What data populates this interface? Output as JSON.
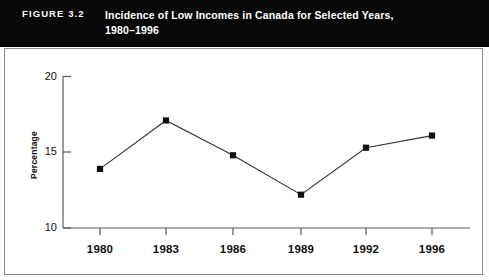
{
  "figure": {
    "label": "FIGURE 3.2",
    "title_line1": "Incidence of Low Incomes in Canada for Selected Years,",
    "title_line2": "1980–1996",
    "banner_color": "#080808",
    "banner_text_color": "#ffffff",
    "panel_border_color": "#8d8d8d"
  },
  "chart_data": {
    "type": "line",
    "title": "Incidence of Low Incomes in Canada for Selected Years, 1980–1996",
    "categories": [
      "1980",
      "1983",
      "1986",
      "1989",
      "1992",
      "1996"
    ],
    "values": [
      13.9,
      17.1,
      14.8,
      12.2,
      15.3,
      16.1
    ],
    "series": [
      {
        "name": "Incidence of low incomes",
        "values": [
          13.9,
          17.1,
          14.8,
          12.2,
          15.3,
          16.1
        ]
      }
    ],
    "xlabel": "",
    "ylabel": "Percentage",
    "ylim": [
      10,
      20
    ],
    "yticks": [
      "10",
      "15",
      "20"
    ],
    "ytick_values": [
      10,
      15,
      20
    ],
    "grid": false,
    "legend": "none",
    "marker": "square",
    "marker_color": "#111111",
    "line_color": "#333333"
  },
  "axes": {
    "y_label": "Percentage",
    "y_ticks": [
      "20",
      "15",
      "10"
    ],
    "x_ticks": [
      "1980",
      "1983",
      "1986",
      "1989",
      "1992",
      "1996"
    ]
  }
}
